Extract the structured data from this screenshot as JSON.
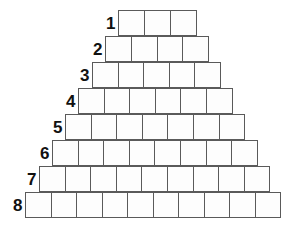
{
  "figure": {
    "background_color": "#ffffff",
    "line_color": "#5a5a5a",
    "cell_fill_color": "#fdfdfd",
    "label_color": "#111111",
    "total_cells": 52,
    "row_count": 8
  },
  "rows": [
    {
      "label": "1",
      "cells": 3,
      "left": 118,
      "top": 10,
      "cell_width": 27.0,
      "cell_height": 26
    },
    {
      "label": "2",
      "cells": 4,
      "left": 105,
      "top": 36,
      "cell_width": 26.8,
      "cell_height": 26
    },
    {
      "label": "3",
      "cells": 5,
      "left": 92,
      "top": 62,
      "cell_width": 26.6,
      "cell_height": 26
    },
    {
      "label": "4",
      "cells": 6,
      "left": 78,
      "top": 88,
      "cell_width": 26.6,
      "cell_height": 26
    },
    {
      "label": "5",
      "cells": 7,
      "left": 65,
      "top": 114,
      "cell_width": 26.6,
      "cell_height": 26
    },
    {
      "label": "6",
      "cells": 8,
      "left": 52,
      "top": 140,
      "cell_width": 26.6,
      "cell_height": 26
    },
    {
      "label": "7",
      "cells": 9,
      "left": 39,
      "top": 166,
      "cell_width": 26.6,
      "cell_height": 26
    },
    {
      "label": "8",
      "cells": 10,
      "left": 25,
      "top": 192,
      "cell_width": 26.5,
      "cell_height": 26
    }
  ]
}
